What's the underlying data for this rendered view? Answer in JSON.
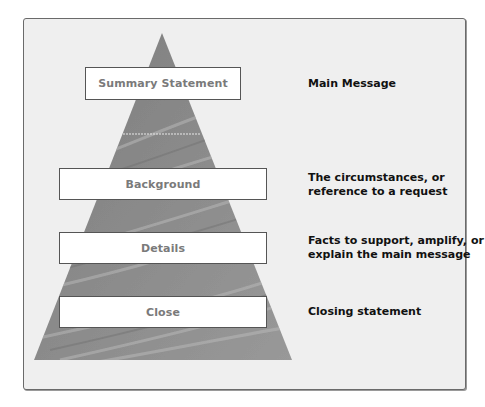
{
  "diagram": {
    "type": "pyramid",
    "colors": {
      "frame_bg": "#efefef",
      "frame_border": "#6a6a6a",
      "pyramid_fill": "#8f8f8f",
      "box_bg": "#ffffff",
      "box_text": "#7a7a7a",
      "label_text": "#111111"
    },
    "levels": [
      {
        "box": "Summary Statement",
        "description": "Main Message"
      },
      {
        "box": "Background",
        "description_lines": [
          "The circumstances, or",
          "reference to a request"
        ]
      },
      {
        "box": "Details",
        "description_lines": [
          "Facts to support, amplify, or",
          "explain the main message"
        ]
      },
      {
        "box": "Close",
        "description": "Closing statement"
      }
    ]
  }
}
